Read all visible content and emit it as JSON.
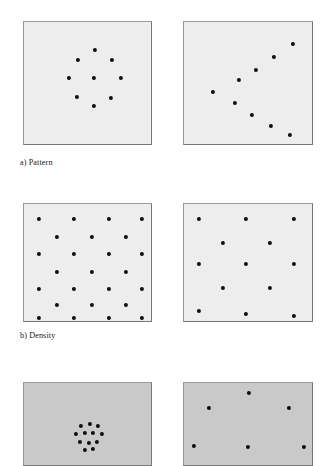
{
  "figure": {
    "background_color": "#ffffff",
    "dot_color": "#0d0d0d",
    "panel_border_color": "#8a8a8a",
    "panel_fill_light": "#ededed",
    "panel_fill_mid": "#c9c9c9",
    "width": 323,
    "height": 466
  },
  "rows": [
    {
      "id": "row-a",
      "caption": "a) Pattern",
      "caption_x": 20,
      "caption_y": 158,
      "panel_fill": "light",
      "panels": [
        {
          "id": "panel-a-left",
          "name": "pattern-clustered-ring",
          "x": 23,
          "y": 21,
          "w": 129,
          "h": 124,
          "dot_size": 4.2,
          "dots": [
            [
              70.5,
              28.0
            ],
            [
              53.5,
              37.5
            ],
            [
              88.0,
              38.0
            ],
            [
              44.5,
              56.0
            ],
            [
              70.0,
              55.5
            ],
            [
              96.5,
              56.0
            ],
            [
              53.0,
              75.0
            ],
            [
              87.0,
              75.5
            ],
            [
              70.0,
              84.0
            ]
          ]
        },
        {
          "id": "panel-a-right",
          "name": "pattern-chevron-v",
          "x": 183,
          "y": 21,
          "w": 130,
          "h": 124,
          "dot_size": 4.2,
          "dots": [
            [
              108.5,
              22.0
            ],
            [
              90.0,
              35.0
            ],
            [
              72.0,
              47.5
            ],
            [
              54.5,
              58.0
            ],
            [
              28.5,
              70.0
            ],
            [
              50.5,
              80.5
            ],
            [
              68.0,
              93.0
            ],
            [
              87.0,
              103.5
            ],
            [
              105.5,
              113.0
            ]
          ]
        }
      ]
    },
    {
      "id": "row-b",
      "caption": "b) Density",
      "caption_x": 20,
      "caption_y": 331,
      "panel_fill": "light",
      "panels": [
        {
          "id": "panel-b-left",
          "name": "density-high-lattice",
          "x": 23,
          "y": 203,
          "w": 129,
          "h": 119,
          "dot_size": 4.2,
          "dots": [
            [
              15.0,
              15.0
            ],
            [
              50.0,
              15.0
            ],
            [
              85.0,
              15.0
            ],
            [
              118.0,
              15.0
            ],
            [
              32.5,
              32.5
            ],
            [
              67.5,
              32.5
            ],
            [
              101.5,
              32.5
            ],
            [
              15.0,
              50.0
            ],
            [
              50.0,
              50.0
            ],
            [
              85.0,
              50.0
            ],
            [
              118.0,
              50.0
            ],
            [
              32.5,
              67.5
            ],
            [
              67.5,
              67.5
            ],
            [
              101.5,
              67.5
            ],
            [
              15.0,
              85.0
            ],
            [
              50.0,
              85.0
            ],
            [
              85.0,
              85.0
            ],
            [
              118.0,
              85.0
            ],
            [
              32.5,
              101.0
            ],
            [
              67.5,
              101.0
            ],
            [
              101.5,
              101.0
            ],
            [
              15.0,
              113.5
            ],
            [
              50.0,
              113.5
            ],
            [
              85.0,
              113.5
            ],
            [
              118.0,
              113.5
            ]
          ]
        },
        {
          "id": "panel-b-right",
          "name": "density-low-lattice",
          "x": 183,
          "y": 203,
          "w": 130,
          "h": 119,
          "dot_size": 4.2,
          "dots": [
            [
              15.0,
              15.0
            ],
            [
              62.0,
              15.0
            ],
            [
              110.0,
              15.0
            ],
            [
              38.5,
              38.5
            ],
            [
              86.0,
              38.5
            ],
            [
              15.0,
              60.0
            ],
            [
              62.0,
              60.0
            ],
            [
              110.0,
              60.0
            ],
            [
              38.5,
              84.0
            ],
            [
              86.0,
              84.0
            ],
            [
              15.0,
              107.0
            ],
            [
              62.0,
              110.0
            ],
            [
              110.0,
              112.0
            ]
          ]
        }
      ]
    },
    {
      "id": "row-c",
      "caption": "",
      "caption_x": 20,
      "caption_y": 470,
      "panel_fill": "mid",
      "panels": [
        {
          "id": "panel-c-left",
          "name": "distribution-tight-cluster",
          "x": 23,
          "y": 382,
          "w": 129,
          "h": 84,
          "dot_size": 4.2,
          "dots": [
            [
              57.0,
              43.0
            ],
            [
              65.5,
              41.0
            ],
            [
              74.0,
              43.0
            ],
            [
              52.0,
              50.5
            ],
            [
              60.5,
              50.0
            ],
            [
              69.0,
              50.0
            ],
            [
              77.5,
              51.0
            ],
            [
              56.0,
              58.5
            ],
            [
              64.5,
              59.5
            ],
            [
              73.0,
              58.5
            ],
            [
              60.5,
              66.5
            ],
            [
              69.0,
              66.0
            ]
          ]
        },
        {
          "id": "panel-c-right",
          "name": "distribution-spread-out",
          "x": 183,
          "y": 382,
          "w": 130,
          "h": 84,
          "dot_size": 4.2,
          "dots": [
            [
              64.5,
              9.5
            ],
            [
              25.0,
              25.0
            ],
            [
              105.0,
              25.0
            ],
            [
              10.0,
              63.0
            ],
            [
              64.0,
              63.5
            ],
            [
              120.0,
              63.5
            ]
          ]
        }
      ]
    }
  ]
}
